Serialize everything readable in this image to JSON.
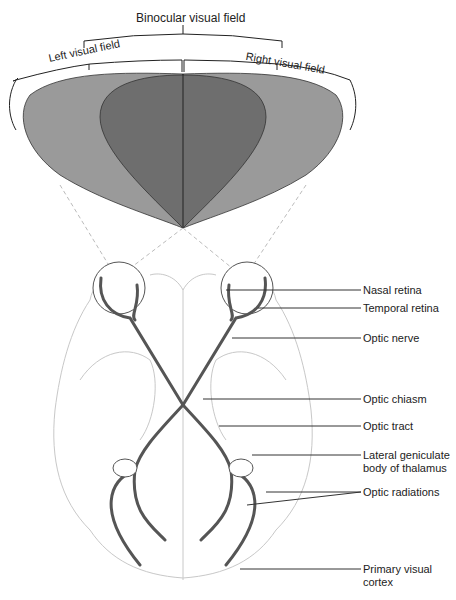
{
  "field_labels": {
    "binocular": "Binocular visual field",
    "left": "Left visual field",
    "right": "Right visual field"
  },
  "callouts": [
    {
      "id": "nasal-retina",
      "text": "Nasal retina"
    },
    {
      "id": "temporal-retina",
      "text": "Temporal retina"
    },
    {
      "id": "optic-nerve",
      "text": "Optic nerve"
    },
    {
      "id": "optic-chiasm",
      "text": "Optic chiasm"
    },
    {
      "id": "optic-tract",
      "text": "Optic tract"
    },
    {
      "id": "lgn",
      "text": "Lateral geniculate",
      "text2": "body of thalamus"
    },
    {
      "id": "optic-radiations",
      "text": "Optic radiations"
    },
    {
      "id": "primary-visual-cortex",
      "text": "Primary visual",
      "text2": "cortex"
    }
  ],
  "colors": {
    "monocular_field": "#9a9a9a",
    "binocular_field": "#6e6e6e",
    "brain_outline": "#c8c8c8",
    "pathway": "#555555",
    "leader": "#333333"
  }
}
